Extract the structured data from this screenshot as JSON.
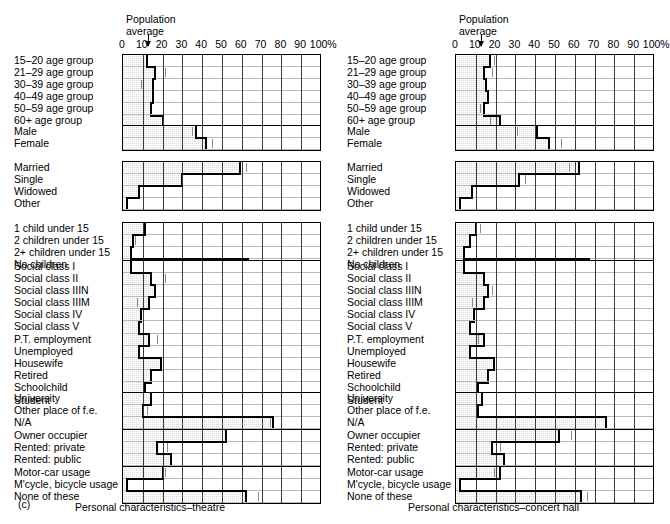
{
  "figure": {
    "label": "(c)",
    "axis_ticks": [
      "0",
      "10",
      "20",
      "30",
      "40",
      "50",
      "60",
      "70",
      "80",
      "90",
      "100%"
    ],
    "population_average_label": "Population\naverage"
  },
  "panels": [
    {
      "id": "theatre",
      "caption": "Personal characteristics–theatre",
      "pop_average": 13,
      "groups": [
        {
          "name": "age",
          "rows": [
            {
              "label": "15–20 age group",
              "value": 12,
              "marker": null
            },
            {
              "label": "21–29 age group",
              "value": 16,
              "marker": 21
            },
            {
              "label": "30–39 age group",
              "value": 15,
              "marker": 9
            },
            {
              "label": "40–49 age group",
              "value": 15,
              "marker": null
            },
            {
              "label": "50–59 age group",
              "value": 14,
              "marker": null
            },
            {
              "label": "60+ age group",
              "value": 20,
              "marker": null
            }
          ]
        },
        {
          "name": "sex",
          "rows": [
            {
              "label": "Male",
              "value": 37,
              "marker": 35
            },
            {
              "label": "Female",
              "value": 42,
              "marker": 45
            }
          ]
        },
        {
          "name": "marital",
          "rows": [
            {
              "label": "Married",
              "value": 59,
              "marker": 62
            },
            {
              "label": "Single",
              "value": 30,
              "marker": null
            },
            {
              "label": "Widowed",
              "value": 8,
              "marker": null
            },
            {
              "label": "Other",
              "value": 2,
              "marker": null
            }
          ]
        },
        {
          "name": "children",
          "rows": [
            {
              "label": "1 child under 15",
              "value": 11,
              "marker": null
            },
            {
              "label": "2 children under 15",
              "value": 5,
              "marker": 6
            },
            {
              "label": "2+ children under 15",
              "value": 4,
              "marker": null
            },
            {
              "label": "No children",
              "value": 63,
              "marker": 70
            }
          ]
        },
        {
          "name": "social",
          "rows": [
            {
              "label": "Social class I",
              "value": 4,
              "marker": null
            },
            {
              "label": "Social class II",
              "value": 14,
              "marker": 21
            },
            {
              "label": "Social class IIIN",
              "value": 16,
              "marker": 20
            },
            {
              "label": "Social class IIIM",
              "value": 13,
              "marker": 7
            },
            {
              "label": "Social class IV",
              "value": 9,
              "marker": null
            },
            {
              "label": "Social class V",
              "value": 8,
              "marker": null
            },
            {
              "label": "P.T. employment",
              "value": 13,
              "marker": 17
            },
            {
              "label": "Unemployed",
              "value": 8,
              "marker": null
            },
            {
              "label": "Housewife",
              "value": 19,
              "marker": null
            },
            {
              "label": "Retired",
              "value": 14,
              "marker": null
            },
            {
              "label": "Schoolchild",
              "value": 11,
              "marker": null
            },
            {
              "label": "Student",
              "value": 4,
              "marker": 6
            }
          ]
        },
        {
          "name": "education",
          "rows": [
            {
              "label": "University",
              "value": 14,
              "marker": null
            },
            {
              "label": "Other place of f.e.",
              "value": 10,
              "marker": 12
            },
            {
              "label": "N/A",
              "value": 76,
              "marker": 74
            }
          ]
        },
        {
          "name": "housing",
          "rows": [
            {
              "label": "Owner occupier",
              "value": 52,
              "marker": null
            },
            {
              "label": "Rented: private",
              "value": 17,
              "marker": 22
            },
            {
              "label": "Rented: public",
              "value": 24,
              "marker": null
            }
          ]
        },
        {
          "name": "transport",
          "rows": [
            {
              "label": "Motor-car usage",
              "value": 20,
              "marker": 21
            },
            {
              "label": "M'cycle, bicycle usage",
              "value": 2,
              "marker": null
            },
            {
              "label": "None of these",
              "value": 62,
              "marker": 68
            }
          ]
        }
      ]
    },
    {
      "id": "concert-hall",
      "caption": "Personal characteristics–concert hall",
      "pop_average": 13,
      "groups": [
        {
          "name": "age",
          "rows": [
            {
              "label": "15–20 age group",
              "value": 17,
              "marker": 19
            },
            {
              "label": "21–29 age group",
              "value": 14,
              "marker": 18
            },
            {
              "label": "30–39 age group",
              "value": 15,
              "marker": null
            },
            {
              "label": "40–49 age group",
              "value": 16,
              "marker": null
            },
            {
              "label": "50–59 age group",
              "value": 14,
              "marker": 12
            },
            {
              "label": "60+ age group",
              "value": 22,
              "marker": 17
            }
          ]
        },
        {
          "name": "sex",
          "rows": [
            {
              "label": "Male",
              "value": 41,
              "marker": 31
            },
            {
              "label": "Female",
              "value": 47,
              "marker": 53
            }
          ]
        },
        {
          "name": "marital",
          "rows": [
            {
              "label": "Married",
              "value": 62,
              "marker": 57
            },
            {
              "label": "Single",
              "value": 32,
              "marker": 35
            },
            {
              "label": "Widowed",
              "value": 8,
              "marker": null
            },
            {
              "label": "Other",
              "value": 2,
              "marker": null
            }
          ]
        },
        {
          "name": "children",
          "rows": [
            {
              "label": "1 child under 15",
              "value": 10,
              "marker": 12
            },
            {
              "label": "2 children under 15",
              "value": 7,
              "marker": null
            },
            {
              "label": "2+ children under 15",
              "value": 4,
              "marker": null
            },
            {
              "label": "No children",
              "value": 67,
              "marker": null
            }
          ]
        },
        {
          "name": "social",
          "rows": [
            {
              "label": "Social class I",
              "value": 4,
              "marker": null
            },
            {
              "label": "Social class II",
              "value": 14,
              "marker": null
            },
            {
              "label": "Social class IIIN",
              "value": 16,
              "marker": 18
            },
            {
              "label": "Social class IIIM",
              "value": 14,
              "marker": 8
            },
            {
              "label": "Social class IV",
              "value": 9,
              "marker": null
            },
            {
              "label": "Social class V",
              "value": 7,
              "marker": null
            },
            {
              "label": "P.T. employment",
              "value": 14,
              "marker": 11
            },
            {
              "label": "Unemployed",
              "value": 7,
              "marker": null
            },
            {
              "label": "Housewife",
              "value": 19,
              "marker": null
            },
            {
              "label": "Retired",
              "value": 16,
              "marker": null
            },
            {
              "label": "Schoolchild",
              "value": 11,
              "marker": null
            },
            {
              "label": "Student",
              "value": 4,
              "marker": 7
            }
          ]
        },
        {
          "name": "education",
          "rows": [
            {
              "label": "University",
              "value": 13,
              "marker": 20
            },
            {
              "label": "Other place of f.e.",
              "value": 11,
              "marker": null
            },
            {
              "label": "N/A",
              "value": 76,
              "marker": 60
            }
          ]
        },
        {
          "name": "housing",
          "rows": [
            {
              "label": "Owner occupier",
              "value": 52,
              "marker": 58
            },
            {
              "label": "Rented: private",
              "value": 18,
              "marker": 22
            },
            {
              "label": "Rented: public",
              "value": 24,
              "marker": null
            }
          ]
        },
        {
          "name": "transport",
          "rows": [
            {
              "label": "Motor-car usage",
              "value": 22,
              "marker": 19
            },
            {
              "label": "M'cycle, bicycle usage",
              "value": 2,
              "marker": null
            },
            {
              "label": "None of these",
              "value": 63,
              "marker": 66
            }
          ]
        }
      ]
    }
  ],
  "chart_data": {
    "type": "bar",
    "xlabel": "Percentage",
    "ylabel": "",
    "xlim": [
      0,
      100
    ],
    "grid": true,
    "legend": "none",
    "annotations": [
      "Population average marker at ~13%"
    ],
    "tick_labels": [
      "0",
      "10",
      "20",
      "30",
      "40",
      "50",
      "60",
      "70",
      "80",
      "90",
      "100%"
    ],
    "series": [
      {
        "name": "theatre",
        "categories": [
          "15–20 age group",
          "21–29 age group",
          "30–39 age group",
          "40–49 age group",
          "50–59 age group",
          "60+ age group",
          "Male",
          "Female",
          "Married",
          "Single",
          "Widowed",
          "Other",
          "1 child under 15",
          "2 children under 15",
          "2+ children under 15",
          "No children",
          "Social class I",
          "Social class II",
          "Social class IIIN",
          "Social class IIIM",
          "Social class IV",
          "Social class V",
          "P.T. employment",
          "Unemployed",
          "Housewife",
          "Retired",
          "Schoolchild",
          "Student",
          "University",
          "Other place of f.e.",
          "N/A",
          "Owner occupier",
          "Rented: private",
          "Rented: public",
          "Motor-car usage",
          "M'cycle, bicycle usage",
          "None of these"
        ],
        "values": [
          12,
          16,
          15,
          15,
          14,
          20,
          37,
          42,
          59,
          30,
          8,
          2,
          11,
          5,
          4,
          63,
          4,
          14,
          16,
          13,
          9,
          8,
          13,
          8,
          19,
          14,
          11,
          4,
          14,
          10,
          76,
          52,
          17,
          24,
          20,
          2,
          62
        ]
      },
      {
        "name": "concert hall",
        "categories": [
          "15–20 age group",
          "21–29 age group",
          "30–39 age group",
          "40–49 age group",
          "50–59 age group",
          "60+ age group",
          "Male",
          "Female",
          "Married",
          "Single",
          "Widowed",
          "Other",
          "1 child under 15",
          "2 children under 15",
          "2+ children under 15",
          "No children",
          "Social class I",
          "Social class II",
          "Social class IIIN",
          "Social class IIIM",
          "Social class IV",
          "Social class V",
          "P.T. employment",
          "Unemployed",
          "Housewife",
          "Retired",
          "Schoolchild",
          "Student",
          "University",
          "Other place of f.e.",
          "N/A",
          "Owner occupier",
          "Rented: private",
          "Rented: public",
          "Motor-car usage",
          "M'cycle, bicycle usage",
          "None of these"
        ],
        "values": [
          17,
          14,
          15,
          16,
          14,
          22,
          41,
          47,
          62,
          32,
          8,
          2,
          10,
          7,
          4,
          67,
          4,
          14,
          16,
          14,
          9,
          7,
          14,
          7,
          19,
          16,
          11,
          4,
          13,
          11,
          76,
          52,
          18,
          24,
          22,
          2,
          63
        ]
      }
    ]
  }
}
